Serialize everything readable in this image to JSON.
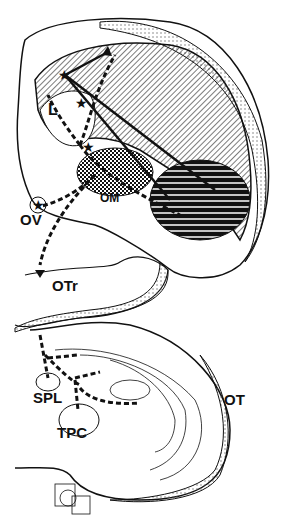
{
  "diagram": {
    "type": "neuroanatomical pathway diagram",
    "labels": {
      "L": "L",
      "OM": "OM",
      "OV": "OV",
      "OTr": "OTr",
      "SPL": "SPL",
      "TPC": "TPC",
      "OT": "OT"
    },
    "colors": {
      "ink": "#111111",
      "background": "#ffffff",
      "stipple": "#bbbbbb"
    }
  }
}
